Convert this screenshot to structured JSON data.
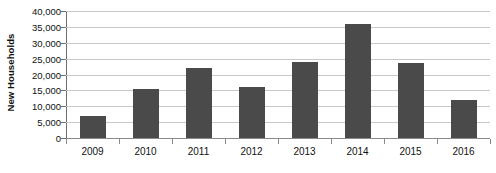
{
  "chart_data": {
    "type": "bar",
    "title": "",
    "xlabel": "",
    "ylabel": "New Households",
    "categories": [
      "2009",
      "2010",
      "2011",
      "2012",
      "2013",
      "2014",
      "2015",
      "2016"
    ],
    "values": [
      7000,
      15500,
      22000,
      16000,
      24000,
      36000,
      23500,
      12000
    ],
    "ylim": [
      0,
      40000
    ],
    "ytick_values": [
      0,
      5000,
      10000,
      15000,
      20000,
      25000,
      30000,
      35000,
      40000
    ],
    "ytick_labels": [
      "0",
      "5,000",
      "10,000",
      "15,000",
      "20,000",
      "25,000",
      "30,000",
      "35,000",
      "40,000"
    ],
    "grid": true,
    "legend": false,
    "bar_color": "#4a4a4a",
    "gridline_color": "#c8c8c8",
    "axis_color": "#8a8a8a"
  }
}
